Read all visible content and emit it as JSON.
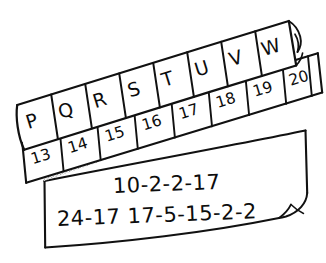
{
  "image": {
    "title": "Hand-drawn letter-to-number cipher key with coded message",
    "background_color": "#ffffff",
    "ink_color": "#111111",
    "shadow_color": "#9a9a9a"
  },
  "letter_strip": {
    "name": "letter-strip",
    "cells": [
      {
        "label": "P"
      },
      {
        "label": "Q"
      },
      {
        "label": "R"
      },
      {
        "label": "S"
      },
      {
        "label": "T"
      },
      {
        "label": "U"
      },
      {
        "label": "V"
      },
      {
        "label": "W"
      }
    ],
    "has_curled_corner": true
  },
  "number_strip": {
    "name": "number-strip",
    "cells": [
      {
        "label": "13"
      },
      {
        "label": "14"
      },
      {
        "label": "15"
      },
      {
        "label": "16"
      },
      {
        "label": "17"
      },
      {
        "label": "18"
      },
      {
        "label": "19"
      },
      {
        "label": "20"
      },
      {
        "label": ""
      }
    ],
    "last_cell_clipped": true
  },
  "note_paper": {
    "name": "note-paper",
    "has_curled_corner": true,
    "lines": [
      {
        "text": "10-2-2-17"
      },
      {
        "text": "24-17  17-5-15-2-2"
      }
    ]
  },
  "shadow_band": {
    "name": "strip-shadow",
    "style": "stippled-gray"
  }
}
